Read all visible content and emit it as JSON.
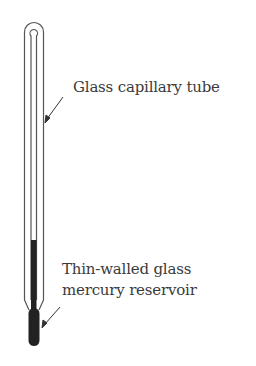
{
  "labels": {
    "capillary": "Glass capillary tube",
    "reservoir_line1": "Thin-walled glass",
    "reservoir_line2": "mercury reservoir"
  },
  "colors": {
    "glass_outline": "#555555",
    "mercury": "#222222",
    "text": "#3a3a3a",
    "background": "#ffffff"
  }
}
